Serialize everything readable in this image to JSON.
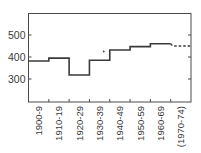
{
  "chart_data": {
    "type": "line",
    "subtype": "step",
    "title": "",
    "xlabel": "",
    "ylabel": "",
    "categories": [
      "1900-9",
      "1910-19",
      "1920-29",
      "1930-39",
      "1940-49",
      "1950-59",
      "1960-69",
      "(1970-74)"
    ],
    "values": [
      382,
      395,
      318,
      385,
      432,
      447,
      460,
      450
    ],
    "dashed_last": true,
    "extra_points": [
      {
        "x_between": [
          "1930-39",
          "1940-49"
        ],
        "y": 425
      }
    ],
    "yticks": [
      300,
      400,
      500
    ],
    "ylim": [
      195,
      600
    ],
    "grid": false,
    "legend": null,
    "color": "#3a3a3a"
  }
}
